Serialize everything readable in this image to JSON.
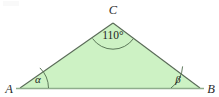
{
  "figure": {
    "type": "geometry-diagram",
    "shape": "triangle",
    "background_color": "#ffffff",
    "fill_color": "#cdf2c4",
    "edge_color": "#5a6b58",
    "base_color": "#8fae8c",
    "arc_color": "#4f6b4d",
    "text_color": "#1f1f1f",
    "vertices": [
      {
        "id": "A",
        "label": "A",
        "x": 20,
        "y": 88,
        "label_x": 9,
        "label_y": 92
      },
      {
        "id": "B",
        "label": "B",
        "x": 200,
        "y": 88,
        "label_x": 211,
        "label_y": 92
      },
      {
        "id": "C",
        "label": "C",
        "x": 113,
        "y": 23,
        "label_x": 113,
        "label_y": 13
      }
    ],
    "angles": [
      {
        "at": "C",
        "label": "110°",
        "value": 110,
        "unit": "degrees",
        "label_x": 113,
        "label_y": 39
      },
      {
        "at": "A",
        "label": "α",
        "name": "alpha",
        "label_x": 38,
        "label_y": 82
      },
      {
        "at": "B",
        "label": "β",
        "name": "beta",
        "label_x": 178,
        "label_y": 82
      }
    ],
    "sides": [
      {
        "from": "A",
        "to": "B",
        "name": "base"
      },
      {
        "from": "A",
        "to": "C",
        "name": "left-side"
      },
      {
        "from": "C",
        "to": "B",
        "name": "right-side"
      }
    ]
  }
}
